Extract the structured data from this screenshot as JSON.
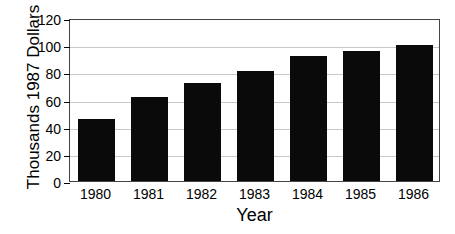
{
  "chart_data": {
    "type": "bar",
    "title": "",
    "xlabel": "Year",
    "ylabel": "Thousands 1987 Dollars",
    "categories": [
      "1980",
      "1981",
      "1982",
      "1983",
      "1984",
      "1985",
      "1986"
    ],
    "values": [
      46,
      62,
      72,
      81,
      92,
      96,
      100
    ],
    "ylim": [
      0,
      120
    ],
    "ytick_labels": [
      "0",
      "20",
      "40",
      "60",
      "80",
      "100",
      "120"
    ],
    "ytick_values": [
      0,
      20,
      40,
      60,
      80,
      100,
      120
    ],
    "grid": true,
    "legend": null,
    "bar_color": "#0a0a0a",
    "grid_color": "#c9c9c9",
    "frame_color": "#444444"
  }
}
